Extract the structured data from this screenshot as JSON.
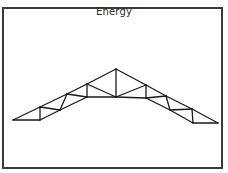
{
  "diagram": {
    "title": "Energy",
    "colors": {
      "line": "#1a1a1a",
      "border": "#3a3a3a",
      "background": "#ffffff"
    },
    "nodes": {
      "A": [
        13,
        120
      ],
      "B": [
        40,
        107
      ],
      "C": [
        67,
        94
      ],
      "D": [
        87,
        84
      ],
      "P": [
        116,
        69
      ],
      "E": [
        146,
        85
      ],
      "F": [
        166,
        96
      ],
      "G": [
        192,
        109
      ],
      "H": [
        218,
        123
      ],
      "b1": [
        40,
        120
      ],
      "b2": [
        60,
        110
      ],
      "b3": [
        87,
        97
      ],
      "M": [
        116,
        97
      ],
      "b4": [
        146,
        98
      ],
      "b5": [
        170,
        110
      ],
      "b6": [
        193,
        123
      ]
    },
    "members": [
      [
        "A",
        "B"
      ],
      [
        "B",
        "C"
      ],
      [
        "C",
        "D"
      ],
      [
        "D",
        "P"
      ],
      [
        "P",
        "E"
      ],
      [
        "E",
        "F"
      ],
      [
        "F",
        "G"
      ],
      [
        "G",
        "H"
      ],
      [
        "A",
        "b1"
      ],
      [
        "b1",
        "b2"
      ],
      [
        "b2",
        "b3"
      ],
      [
        "b3",
        "M"
      ],
      [
        "M",
        "b4"
      ],
      [
        "b4",
        "b5"
      ],
      [
        "b5",
        "b6"
      ],
      [
        "b6",
        "H"
      ],
      [
        "B",
        "b1"
      ],
      [
        "B",
        "b2"
      ],
      [
        "C",
        "b2"
      ],
      [
        "C",
        "b3"
      ],
      [
        "D",
        "b3"
      ],
      [
        "D",
        "M"
      ],
      [
        "P",
        "M"
      ],
      [
        "E",
        "M"
      ],
      [
        "E",
        "b4"
      ],
      [
        "F",
        "b4"
      ],
      [
        "F",
        "b5"
      ],
      [
        "G",
        "b5"
      ],
      [
        "G",
        "b6"
      ]
    ]
  }
}
